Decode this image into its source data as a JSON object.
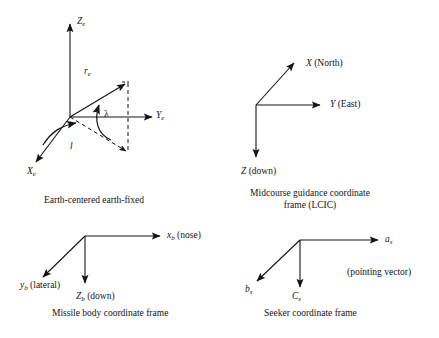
{
  "figure": {
    "background_color": "#ffffff",
    "stroke_color": "#141414",
    "width": 439,
    "height": 338
  },
  "panels": {
    "ecef": {
      "caption": "Earth-centered earth-fixed",
      "axes": [
        {
          "name": "z-axis",
          "label_letter": "Z",
          "label_sub": "e"
        },
        {
          "name": "y-axis",
          "label_letter": "Y",
          "label_sub": "e"
        },
        {
          "name": "x-axis",
          "label_letter": "X",
          "label_sub": "e"
        }
      ],
      "vectors": [
        {
          "name": "position-vector",
          "label_letter": "r",
          "label_sub": "e"
        }
      ],
      "angles": [
        {
          "name": "latitude-angle",
          "label": "λ"
        },
        {
          "name": "longitude-angle",
          "label": "l"
        }
      ]
    },
    "lcic": {
      "caption_line1": "Midcourse guidance coordinate",
      "caption_line2": "frame (LCIC)",
      "axes": [
        {
          "name": "x-axis",
          "label_letter": "X",
          "label_rm": " (North)"
        },
        {
          "name": "y-axis",
          "label_letter": "Y",
          "label_rm": " (East)"
        },
        {
          "name": "z-axis",
          "label_letter": "Z",
          "label_rm": " (down)"
        }
      ]
    },
    "body": {
      "caption": "Missile body coordinate frame",
      "axes": [
        {
          "name": "x-axis",
          "label_letter": "x",
          "label_sub": "b",
          "label_rm": " (nose)"
        },
        {
          "name": "y-axis",
          "label_letter": "y",
          "label_sub": "b",
          "label_rm": " (lateral)"
        },
        {
          "name": "z-axis",
          "label_letter": "Z",
          "label_sub": "b",
          "label_rm": " (down)"
        }
      ]
    },
    "seeker": {
      "caption": "Seeker coordinate frame",
      "note": "(pointing vector)",
      "axes": [
        {
          "name": "a-axis",
          "label_letter": "a",
          "label_sub": "s"
        },
        {
          "name": "b-axis",
          "label_letter": "b",
          "label_sub": "s"
        },
        {
          "name": "c-axis",
          "label_letter": "C",
          "label_sub": "s"
        }
      ]
    }
  }
}
